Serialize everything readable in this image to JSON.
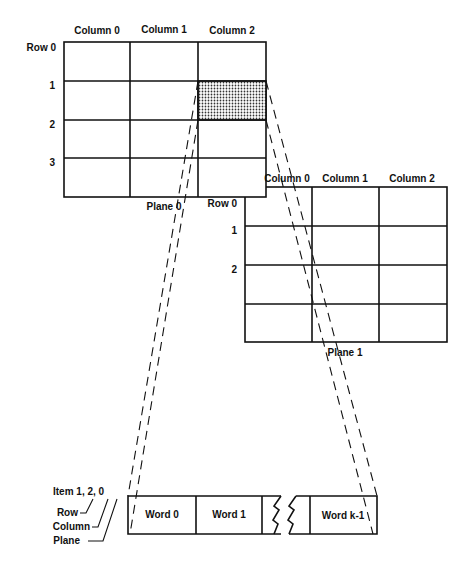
{
  "plane0": {
    "title": "Plane 0",
    "columns": [
      "Column 0",
      "Column 1",
      "Column 2"
    ],
    "rows": [
      "Row 0",
      "1",
      "2",
      "3"
    ]
  },
  "plane1": {
    "title": "Plane 1",
    "columns": [
      "Column 0",
      "Column 1",
      "Column 2"
    ],
    "rows": [
      "Row 0",
      "1",
      "2"
    ]
  },
  "item": {
    "label": "Item 1, 2, 0",
    "index_labels": [
      "Row",
      "Column",
      "Plane"
    ],
    "highlighted_cell": {
      "row": 1,
      "column": 2,
      "plane": 0
    }
  },
  "words": [
    "Word 0",
    "Word 1",
    "Word k-1"
  ],
  "colors": {
    "line": "#111111",
    "shade": "#b8b8b8",
    "background": "#ffffff"
  }
}
